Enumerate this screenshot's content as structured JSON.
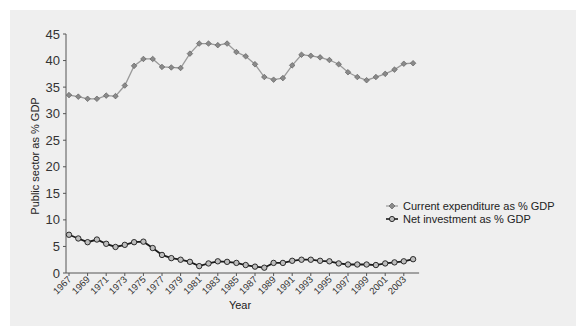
{
  "chart_data": {
    "type": "line",
    "title": "",
    "xlabel": "Year",
    "ylabel": "Public sector as % GDP",
    "ylim": [
      0,
      45
    ],
    "yticks": [
      0,
      5,
      10,
      15,
      20,
      25,
      30,
      35,
      40,
      45
    ],
    "xtick_labels": [
      "1967",
      "1969",
      "1971",
      "1973",
      "1975",
      "1977",
      "1979",
      "1981",
      "1983",
      "1985",
      "1987",
      "1989",
      "1991",
      "1993",
      "1995",
      "1997",
      "1999",
      "2001",
      "2003"
    ],
    "grid": false,
    "legend_position": "right",
    "x": [
      1967,
      1968,
      1969,
      1970,
      1971,
      1972,
      1973,
      1974,
      1975,
      1976,
      1977,
      1978,
      1979,
      1980,
      1981,
      1982,
      1983,
      1984,
      1985,
      1986,
      1987,
      1988,
      1989,
      1990,
      1991,
      1992,
      1993,
      1994,
      1995,
      1996,
      1997,
      1998,
      1999,
      2000,
      2001,
      2002,
      2003,
      2004
    ],
    "series": [
      {
        "name": "Current expenditure as % GDP",
        "color": "#9a9a9a",
        "marker": "diamond",
        "values": [
          33.5,
          33.2,
          32.8,
          32.8,
          33.4,
          33.3,
          35.3,
          39.0,
          40.3,
          40.3,
          38.8,
          38.7,
          38.6,
          41.3,
          43.2,
          43.2,
          42.9,
          43.2,
          41.6,
          40.8,
          39.3,
          36.9,
          36.4,
          36.7,
          39.1,
          41.1,
          40.9,
          40.6,
          40.1,
          39.3,
          37.8,
          36.9,
          36.3,
          36.9,
          37.5,
          38.3,
          39.4,
          39.5
        ]
      },
      {
        "name": "Net investment as % GDP",
        "color": "#1a1a1a",
        "marker": "circle",
        "values": [
          7.2,
          6.5,
          5.8,
          6.3,
          5.5,
          4.9,
          5.3,
          5.8,
          5.9,
          4.7,
          3.4,
          2.8,
          2.5,
          2.1,
          1.3,
          1.8,
          2.2,
          2.1,
          1.9,
          1.5,
          1.2,
          1.0,
          1.9,
          1.9,
          2.3,
          2.5,
          2.5,
          2.3,
          2.2,
          1.8,
          1.6,
          1.6,
          1.6,
          1.5,
          1.8,
          2.0,
          2.2,
          2.6
        ]
      }
    ]
  },
  "legend": {
    "items": [
      {
        "label": "Current expenditure as % GDP"
      },
      {
        "label": "Net investment as % GDP"
      }
    ]
  },
  "axes": {
    "x_title": "Year",
    "y_title": "Public sector as % GDP"
  },
  "colors": {
    "panel_background": "#efefef",
    "axis": "#555555",
    "series_current": "#9a9a9a",
    "series_current_marker": "#777777",
    "series_net": "#1a1a1a",
    "series_net_marker_fill": "#bdbdbd"
  }
}
